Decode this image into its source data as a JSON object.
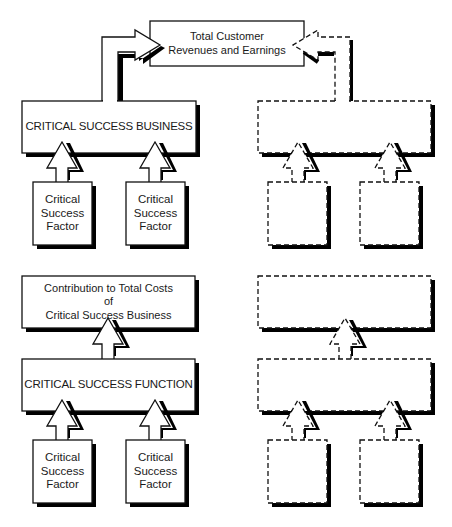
{
  "diagram": {
    "top_outcome": {
      "line1": "Total Customer",
      "line2": "Revenues and Earnings"
    },
    "left_upper": {
      "business_box": "CRITICAL SUCCESS BUSINESS",
      "factors": [
        {
          "line1": "Critical",
          "line2": "Success",
          "line3": "Factor"
        },
        {
          "line1": "Critical",
          "line2": "Success",
          "line3": "Factor"
        }
      ]
    },
    "left_lower": {
      "contribution_box": {
        "line1": "Contribution to Total Costs",
        "line2": "of",
        "line3": "Critical Success Business"
      },
      "function_box": "CRITICAL SUCCESS FUNCTION",
      "factors": [
        {
          "line1": "Critical",
          "line2": "Success",
          "line3": "Factor"
        },
        {
          "line1": "Critical",
          "line2": "Success",
          "line3": "Factor"
        }
      ]
    },
    "right_upper": {
      "style": "dashed",
      "boxes": [
        "",
        "",
        ""
      ]
    },
    "right_lower": {
      "style": "dashed",
      "boxes": [
        "",
        "",
        "",
        ""
      ]
    },
    "colors": {
      "stroke": "#111111",
      "shadow": "#000000",
      "fill": "#ffffff"
    }
  }
}
